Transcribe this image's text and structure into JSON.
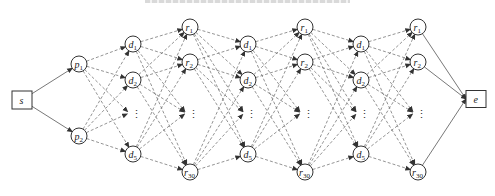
{
  "caption": {
    "visible": "cropped, illegible"
  },
  "diagram": {
    "source": {
      "id": "s",
      "label": "s",
      "shape": "box"
    },
    "sink": {
      "id": "e",
      "label": "e",
      "shape": "box"
    },
    "p_column": [
      {
        "id": "p1",
        "base": "p",
        "sub": "1"
      },
      {
        "id": "p2",
        "base": "p",
        "sub": "2"
      }
    ],
    "d_nodes": [
      {
        "base": "d",
        "sub": "1"
      },
      {
        "base": "d",
        "sub": "2"
      },
      {
        "base": "d",
        "sub": "5"
      }
    ],
    "r_nodes": [
      {
        "base": "r",
        "sub": "1"
      },
      {
        "base": "r",
        "sub": "2"
      },
      {
        "base": "r",
        "sub": "30"
      }
    ],
    "ellipsis": "⋮",
    "layer_sequence": [
      "s",
      "p",
      "d",
      "r",
      "d",
      "r",
      "d",
      "r",
      "e"
    ],
    "edge_styles": {
      "s_to_p": "solid",
      "p_to_d": "dashed",
      "d_to_r": "dashed",
      "r_to_d": "dashed",
      "r_to_e": "solid"
    }
  }
}
